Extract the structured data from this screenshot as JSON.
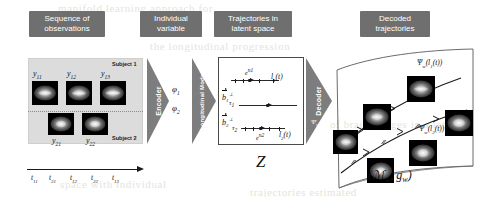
{
  "figure": {
    "captions": {
      "observations": {
        "line1": "Sequence of",
        "line2": "observations"
      },
      "individual": {
        "line1": "Individual",
        "line2": "variable"
      },
      "latent": {
        "line1": "Trajectories in",
        "line2": "latent space"
      },
      "decoded": {
        "line1": "Decoded",
        "line2": "trajectories"
      }
    },
    "observations_panel": {
      "subject1_tag": "Subject 1",
      "subject2_tag": "Subject 2",
      "subject1_labels": [
        "y11",
        "y12",
        "y13"
      ],
      "subject2_labels": [
        "y21",
        "y22"
      ],
      "subject1_label_parts": [
        {
          "base": "y",
          "sub": "11"
        },
        {
          "base": "y",
          "sub": "12"
        },
        {
          "base": "y",
          "sub": "13"
        }
      ],
      "subject2_label_parts": [
        {
          "base": "y",
          "sub": "21"
        },
        {
          "base": "y",
          "sub": "22"
        }
      ]
    },
    "time_axis": {
      "ticks": [
        "t11",
        "t21",
        "t12",
        "t22",
        "t13"
      ],
      "tick_parts": [
        {
          "base": "t",
          "sub": "11"
        },
        {
          "base": "t",
          "sub": "21"
        },
        {
          "base": "t",
          "sub": "12"
        },
        {
          "base": "t",
          "sub": "22"
        },
        {
          "base": "t",
          "sub": "13"
        }
      ]
    },
    "encoder_arrow": {
      "label": "Encoder",
      "symbol": ""
    },
    "individual_variables": [
      {
        "base": "φ",
        "sub": "1"
      },
      {
        "base": "φ",
        "sub": "2"
      }
    ],
    "longitudinal_arrow": {
      "label": "Longitudinal Model"
    },
    "latent_space": {
      "symbol": "𝒵",
      "symbol_plain": "Z",
      "rows": [
        {
          "subject": "1",
          "time_label": "l1(t)",
          "noise_label": "eⁿ¹",
          "tau_label": ""
        },
        {
          "subject": "",
          "time_label": "",
          "noise_label": "",
          "tau_label": "τ1"
        },
        {
          "subject": "2",
          "time_label": "l2(t)",
          "noise_label": "eⁿ²",
          "tau_label": "τ2"
        }
      ],
      "vectors": [
        {
          "base": "b",
          "sub": "1",
          "sup": "⊥"
        },
        {
          "base": "b",
          "sub": "2",
          "sup": "⊥"
        }
      ],
      "taus": [
        {
          "base": "τ",
          "sub": "1"
        },
        {
          "base": "τ",
          "sub": "2"
        }
      ],
      "latent_curves": [
        {
          "base": "l",
          "sub": "1",
          "arg": "(t)"
        },
        {
          "base": "l",
          "sub": "2",
          "arg": "(t)"
        }
      ],
      "noise_terms": [
        {
          "base": "e",
          "sup": "n1"
        },
        {
          "base": "e",
          "sup": "n2"
        }
      ]
    },
    "decoder_arrow": {
      "label": "Decoder",
      "symbol": "Ψ",
      "symbol_sub": "w"
    },
    "manifold": {
      "label_base": "ℳ",
      "label_sub_1": "w",
      "label_base_2": "g",
      "label_sub_2": "w",
      "label_plain": "(ℳw, gw)",
      "trajectory_labels": [
        {
          "psi": "Ψ",
          "psi_sub": "w",
          "arg_base": "l",
          "arg_sub": "1",
          "arg_tail": "(t)"
        },
        {
          "psi": "Ψ",
          "psi_sub": "w",
          "arg_base": "l",
          "arg_sub": "2",
          "arg_tail": "(t)"
        }
      ]
    },
    "background_bleed": [
      "manifold learning approach for",
      "the longitudinal progression",
      "of brain images in a latent",
      "space with individual",
      "trajectories estimated"
    ],
    "colors": {
      "caption_box": "#6f6f6f",
      "caption_text": "#ffffff",
      "panel_bg": "#dcdcdc",
      "arrow_gray": "#7d7d7d",
      "ink": "#111111",
      "brain_bg": "#000000"
    }
  }
}
